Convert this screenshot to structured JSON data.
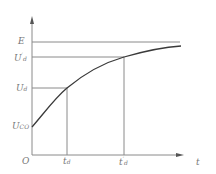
{
  "diagram": {
    "type": "charging-curve",
    "colors": {
      "axis": "#8a8a8a",
      "curve": "#3a3a3a",
      "label": "#777777"
    },
    "y_axis_labels": [
      {
        "id": "E",
        "main": "E",
        "sub": "",
        "prime": ""
      },
      {
        "id": "Ud_prime",
        "main": "U",
        "sub": "d",
        "prime": "′"
      },
      {
        "id": "Ud",
        "main": "U",
        "sub": "d",
        "prime": ""
      },
      {
        "id": "Uco",
        "main": "U",
        "sub": "CO",
        "prime": ""
      }
    ],
    "x_axis_labels": [
      {
        "id": "origin",
        "main": "O",
        "sub": "",
        "prime": ""
      },
      {
        "id": "td",
        "main": "t",
        "sub": "d",
        "prime": ""
      },
      {
        "id": "td_prime",
        "main": "t",
        "sub": "d",
        "prime": "′"
      },
      {
        "id": "t",
        "main": "t",
        "sub": "",
        "prime": ""
      }
    ]
  }
}
